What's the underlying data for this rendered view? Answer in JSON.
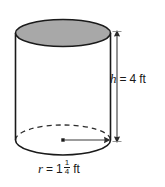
{
  "figure": {
    "shape": "cylinder",
    "title": "",
    "background_color": "#ffffff",
    "outline_color": "#1a1a1a",
    "top_face_fill": "#a8a8a8",
    "body_fill": "#ffffff",
    "hidden_edge_style": "dashed"
  },
  "labels": {
    "height": {
      "variable": "h",
      "equals": "=",
      "value": "4",
      "unit": "ft",
      "full_text": "h = 4 ft"
    },
    "radius": {
      "variable": "r",
      "equals": "=",
      "whole": "1",
      "numerator": "1",
      "denominator": "4",
      "unit": "ft",
      "full_text": "r = 1 1/4 ft"
    }
  },
  "dimensions": {
    "height_arrow": "double-headed-vertical",
    "radius_arrow": "single-headed-right"
  }
}
